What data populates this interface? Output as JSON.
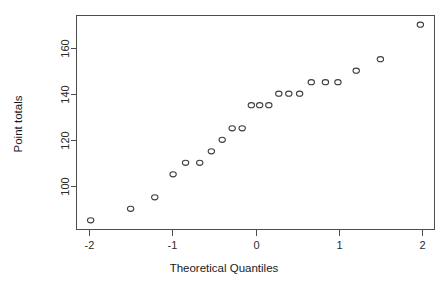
{
  "chart_data": {
    "type": "scatter",
    "title": "",
    "xlabel": "Theoretical Quantiles",
    "ylabel": "Point totals",
    "xlim": [
      -2.15,
      2.15
    ],
    "ylim": [
      81,
      174
    ],
    "xticks": [
      -2,
      -1,
      0,
      1,
      2
    ],
    "xticklabels": [
      "-2",
      "-1",
      "0",
      "1",
      "2"
    ],
    "yticks": [
      100,
      120,
      140,
      160
    ],
    "yticklabels": [
      "100",
      "120",
      "140",
      "160"
    ],
    "grid": false,
    "legend": null,
    "marker": "open-circle",
    "x": [
      -1.98,
      -1.5,
      -1.21,
      -0.99,
      -0.84,
      -0.67,
      -0.53,
      -0.4,
      -0.28,
      -0.16,
      -0.05,
      0.05,
      0.16,
      0.28,
      0.4,
      0.53,
      0.67,
      0.84,
      0.99,
      1.21,
      1.5,
      1.98
    ],
    "y": [
      85,
      90,
      95,
      105,
      110,
      110,
      115,
      120,
      125,
      125,
      135,
      135,
      135,
      140,
      140,
      140,
      145,
      145,
      145,
      150,
      155,
      170
    ],
    "points": [
      {
        "x": -1.98,
        "y": 85
      },
      {
        "x": -1.5,
        "y": 90
      },
      {
        "x": -1.21,
        "y": 95
      },
      {
        "x": -0.99,
        "y": 105
      },
      {
        "x": -0.84,
        "y": 110
      },
      {
        "x": -0.67,
        "y": 110
      },
      {
        "x": -0.53,
        "y": 115
      },
      {
        "x": -0.4,
        "y": 120
      },
      {
        "x": -0.28,
        "y": 125
      },
      {
        "x": -0.16,
        "y": 125
      },
      {
        "x": -0.05,
        "y": 135
      },
      {
        "x": 0.05,
        "y": 135
      },
      {
        "x": 0.16,
        "y": 135
      },
      {
        "x": 0.28,
        "y": 140
      },
      {
        "x": 0.4,
        "y": 140
      },
      {
        "x": 0.53,
        "y": 140
      },
      {
        "x": 0.67,
        "y": 145
      },
      {
        "x": 0.84,
        "y": 145
      },
      {
        "x": 0.99,
        "y": 145
      },
      {
        "x": 1.21,
        "y": 150
      },
      {
        "x": 1.5,
        "y": 155
      },
      {
        "x": 1.98,
        "y": 170
      }
    ]
  },
  "colors": {
    "background": "#ffffff",
    "axis": "#4d4d4d",
    "point_stroke": "#3d3d3d",
    "text": "#1a1a1a"
  }
}
